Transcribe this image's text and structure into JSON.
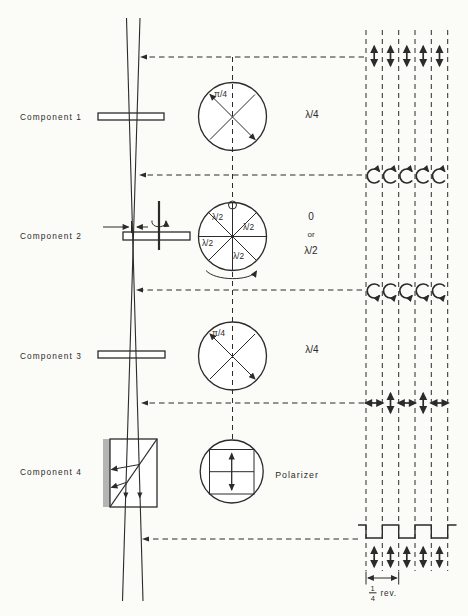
{
  "colors": {
    "ink": "#2b2b2b",
    "paper": "#fbfbf8",
    "absorber": "#b4b4b4"
  },
  "components": [
    {
      "label": "Component 1",
      "dial_label": "π/4",
      "effect": "λ/4"
    },
    {
      "label": "Component 2",
      "sector_labels": [
        "λ/2",
        "λ/2",
        "λ/2",
        "λ/2"
      ],
      "effect_lines": [
        "0",
        "or",
        "λ/2"
      ]
    },
    {
      "label": "Component 3",
      "dial_label": "π/4",
      "effect": "λ/4"
    },
    {
      "label": "Component 4",
      "effect": "Polarizer"
    }
  ],
  "scale": {
    "numerator": "1",
    "denominator": "4",
    "unit": "rev."
  },
  "icons": {
    "linear_vertical": "double-headed vertical arrow",
    "linear_horizontal": "double-headed horizontal arrow",
    "circular_cw": "clockwise circular arrow",
    "circular_ccw": "counterclockwise circular arrow"
  }
}
